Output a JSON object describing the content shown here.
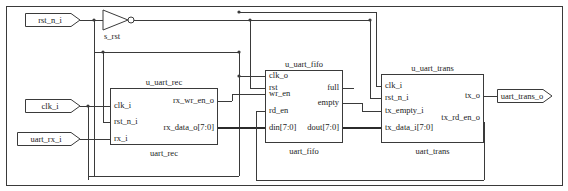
{
  "diagram": {
    "line_color": "#3a3a3a",
    "bus_color": "#2b2b2b",
    "text_color": "#1a1a1a",
    "background": "#ffffff"
  },
  "ports": {
    "inputs": [
      {
        "name": "rst_n_i",
        "label": "rst_n_i"
      },
      {
        "name": "clk_i",
        "label": "clk_i"
      },
      {
        "name": "uart_rx_i",
        "label": "uart_rx_i"
      }
    ],
    "outputs": [
      {
        "name": "uart_trans_o",
        "label": "uart_trans_o"
      }
    ]
  },
  "gates": [
    {
      "name": "inverter",
      "type": "not",
      "output_net": "s_rst",
      "label": "s_rst"
    }
  ],
  "blocks": [
    {
      "name": "u_uart_rec",
      "instance": "u_uart_rec",
      "module": "uart_rec",
      "inputs": [
        "clk_i",
        "rst_n_i",
        "rx_i"
      ],
      "outputs": [
        "rx_wr_en_o",
        "rx_data_o[7:0]"
      ]
    },
    {
      "name": "u_uart_fifo",
      "instance": "u_uart_fifo",
      "module": "uart_fifo",
      "inputs": [
        "clk_o",
        "rst",
        "wr_en",
        "rd_en",
        "din[7:0]"
      ],
      "outputs": [
        "full",
        "empty",
        "dout[7:0]"
      ]
    },
    {
      "name": "u_uart_trans",
      "instance": "u_uart_trans",
      "module": "uart_trans",
      "inputs": [
        "clk_i",
        "rst_n_i",
        "tx_empty_i",
        "tx_data_i[7:0]"
      ],
      "outputs": [
        "tx_o",
        "tx_rd_en_o"
      ]
    }
  ]
}
